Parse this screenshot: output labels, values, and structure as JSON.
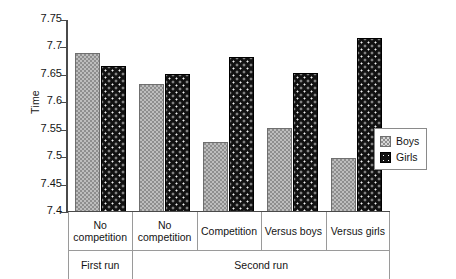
{
  "chart_data": {
    "type": "bar",
    "title": "",
    "xlabel": "",
    "ylabel": "Time",
    "ylim": [
      7.4,
      7.75
    ],
    "yticks": [
      "7.4",
      "7.45",
      "7.5",
      "7.55",
      "7.6",
      "7.65",
      "7.7",
      "7.75"
    ],
    "ytick_values": [
      7.4,
      7.45,
      7.5,
      7.55,
      7.6,
      7.65,
      7.7,
      7.75
    ],
    "grid": false,
    "legend_position": "right",
    "categories": [
      "No competition",
      "No competition",
      "Competition",
      "Versus boys",
      "Versus girls"
    ],
    "group_labels": [
      "First run",
      "Second run"
    ],
    "group_spans": [
      1,
      4
    ],
    "series": [
      {
        "name": "Boys",
        "values": [
          7.69,
          7.633,
          7.527,
          7.553,
          7.499
        ]
      },
      {
        "name": "Girls",
        "values": [
          7.667,
          7.652,
          7.683,
          7.653,
          7.717
        ]
      }
    ]
  },
  "legend": {
    "items": [
      {
        "label": "Boys",
        "swatch": "gray-checker-swatch"
      },
      {
        "label": "Girls",
        "swatch": "black-dotted-swatch"
      }
    ]
  }
}
